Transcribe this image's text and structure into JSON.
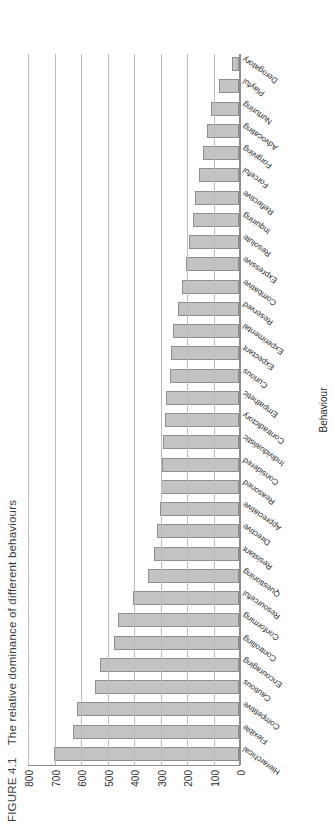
{
  "figure": {
    "number": "FIGURE 4.1",
    "caption": "The relative dominance of different behaviours"
  },
  "axis": {
    "category_axis_title": "Behaviour",
    "value_ticks": [
      "0",
      "100",
      "200",
      "300",
      "400",
      "500",
      "600",
      "700",
      "800"
    ]
  },
  "style": {
    "bar_fill": "#c3c3c3",
    "bar_stroke": "#8f8f8f",
    "gridline": "#bdbdbd",
    "axis": "#8c8c8c",
    "text": "#2b2b2b"
  },
  "chart_data": {
    "type": "bar",
    "title": "The relative dominance of different behaviours",
    "xlabel": "Behaviour",
    "ylabel": "",
    "ylim": [
      0,
      800
    ],
    "grid": true,
    "legend": false,
    "orientation": "vertical",
    "categories": [
      "Hierarchical",
      "Flexible",
      "Competitive",
      "Cautious",
      "Encouraging",
      "Controlling",
      "Conforming",
      "Resourceful",
      "Questioning",
      "Resistant",
      "Directive",
      "Appreciative",
      "Reasoned",
      "Considered",
      "Individualistic",
      "Contradictory",
      "Empathetic",
      "Curious",
      "Expectant",
      "Experimental",
      "Reserved",
      "Combative",
      "Expressive",
      "Resolute",
      "Inquiring",
      "Reflective",
      "Forceful",
      "Forgiving",
      "Advocating",
      "Nurturing",
      "Playful",
      "Derogatory"
    ],
    "values": [
      700,
      625,
      610,
      545,
      525,
      470,
      455,
      400,
      345,
      320,
      310,
      300,
      295,
      290,
      285,
      280,
      275,
      260,
      255,
      250,
      230,
      215,
      200,
      190,
      175,
      165,
      150,
      135,
      120,
      105,
      75,
      25
    ]
  }
}
